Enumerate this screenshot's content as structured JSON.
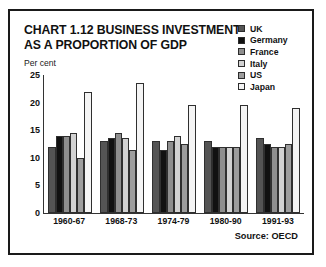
{
  "title": {
    "line1": "CHART 1.12 BUSINESS INVESTMENT",
    "line2": "AS A PROPORTION OF GDP"
  },
  "source_note": "Source: OECD",
  "legend": {
    "items": [
      {
        "label": "UK",
        "color": "#545454"
      },
      {
        "label": "Germany",
        "color": "#111111"
      },
      {
        "label": "France",
        "color": "#8e8e8e"
      },
      {
        "label": "Italy",
        "color": "#d2d2d2"
      },
      {
        "label": "US",
        "color": "#9d9d9d"
      },
      {
        "label": "Japan",
        "color": "#f4f4f4"
      }
    ]
  },
  "chart_data": {
    "type": "bar",
    "title": "CHART 1.12 BUSINESS INVESTMENT AS A PROPORTION OF GDP",
    "xlabel": "",
    "ylabel": "Per cent",
    "ylim": [
      0,
      25
    ],
    "yticks": [
      0,
      5,
      10,
      15,
      20,
      25
    ],
    "grid": false,
    "legend_position": "top-right",
    "categories": [
      "1960-67",
      "1968-73",
      "1974-79",
      "1980-90",
      "1991-93"
    ],
    "series": [
      {
        "name": "UK",
        "color": "#545454",
        "values": [
          12.0,
          13.0,
          13.0,
          13.0,
          13.5
        ]
      },
      {
        "name": "Germany",
        "color": "#111111",
        "values": [
          14.0,
          13.5,
          11.5,
          12.0,
          12.5
        ]
      },
      {
        "name": "France",
        "color": "#8e8e8e",
        "values": [
          14.0,
          14.5,
          13.0,
          12.0,
          12.0
        ]
      },
      {
        "name": "Italy",
        "color": "#d2d2d2",
        "values": [
          14.5,
          13.5,
          14.0,
          12.0,
          12.0
        ]
      },
      {
        "name": "US",
        "color": "#9d9d9d",
        "values": [
          10.0,
          11.5,
          12.5,
          12.0,
          12.5
        ]
      },
      {
        "name": "Japan",
        "color": "#f4f4f4",
        "values": [
          22.0,
          23.5,
          19.5,
          19.5,
          19.0
        ]
      }
    ]
  }
}
